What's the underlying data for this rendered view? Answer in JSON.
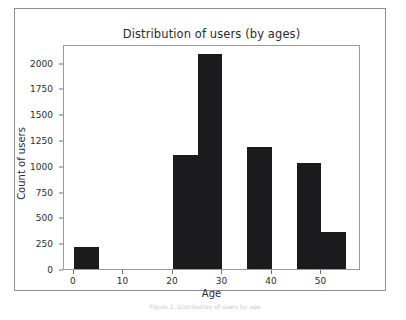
{
  "figure": {
    "title": "Distribution of users (by ages)",
    "caption": "Figure 1. Distribution of users by age",
    "background_color": "#ffffff",
    "frame_color": "#8d8d8f",
    "bar_color": "#1b1b1e",
    "axis_color": "#9a9a9c",
    "text_color": "#2b2b33"
  },
  "chart_data": {
    "type": "bar",
    "title": "Distribution of users (by ages)",
    "xlabel": "Age",
    "ylabel": "Count of users",
    "xlim": [
      -2,
      58
    ],
    "ylim": [
      0,
      2180
    ],
    "grid": false,
    "legend": null,
    "bin_width": 5,
    "x_ticks": [
      0,
      10,
      20,
      30,
      40,
      50
    ],
    "x_tick_labels": [
      "0",
      "10",
      "20",
      "30",
      "40",
      "50"
    ],
    "y_ticks": [
      0,
      250,
      500,
      750,
      1000,
      1250,
      1500,
      1750,
      2000
    ],
    "y_tick_labels": [
      "0",
      "250",
      "500",
      "750",
      "1000",
      "1250",
      "1500",
      "1750",
      "2000"
    ],
    "bins": [
      {
        "x0": 0,
        "x1": 5,
        "value": 218
      },
      {
        "x0": 5,
        "x1": 10,
        "value": 0
      },
      {
        "x0": 10,
        "x1": 15,
        "value": 0
      },
      {
        "x0": 15,
        "x1": 20,
        "value": 0
      },
      {
        "x0": 20,
        "x1": 25,
        "value": 1100
      },
      {
        "x0": 25,
        "x1": 30,
        "value": 2080
      },
      {
        "x0": 30,
        "x1": 35,
        "value": 0
      },
      {
        "x0": 35,
        "x1": 40,
        "value": 1185
      },
      {
        "x0": 40,
        "x1": 45,
        "value": 0
      },
      {
        "x0": 45,
        "x1": 50,
        "value": 1030
      },
      {
        "x0": 50,
        "x1": 55,
        "value": 360
      }
    ],
    "categories": [
      "0-5",
      "5-10",
      "10-15",
      "15-20",
      "20-25",
      "25-30",
      "30-35",
      "35-40",
      "40-45",
      "45-50",
      "50-55"
    ],
    "values": [
      218,
      0,
      0,
      0,
      1100,
      2080,
      0,
      1185,
      0,
      1030,
      360
    ]
  }
}
